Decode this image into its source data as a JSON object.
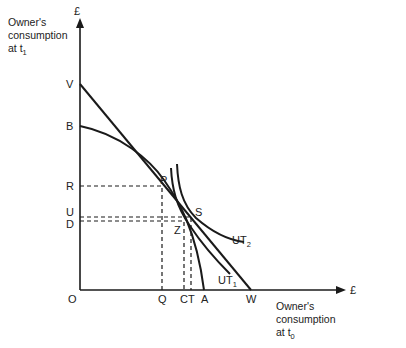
{
  "diagram": {
    "type": "indifference-curve diagram",
    "y_axis": {
      "unit": "£",
      "title_line1": "Owner's",
      "title_line2": "consumption",
      "title_line3": "at t",
      "title_sub": "1"
    },
    "x_axis": {
      "unit": "£",
      "title_line1": "Owner's",
      "title_line2": "consumption",
      "title_line3": "at t",
      "title_sub": "0"
    },
    "origin_label": "O",
    "y_labels": {
      "V": "V",
      "B": "B",
      "R": "R",
      "U": "U",
      "D": "D"
    },
    "x_labels": {
      "Q": "Q",
      "C": "C",
      "T": "T",
      "A": "A",
      "W": "W"
    },
    "point_labels": {
      "P": "P",
      "S": "S",
      "Z": "Z"
    },
    "curves": {
      "ut1": {
        "label": "UT",
        "sub": "1"
      },
      "ut2": {
        "label": "UT",
        "sub": "2"
      }
    },
    "elements": [
      "Straight market line V–W",
      "Concave production opportunity curve B–A",
      "Indifference curve UT1 tangent at P",
      "Indifference curve UT2 tangent at S",
      "Dashed projections R–P–Q, U–S–T, D–Z–C"
    ]
  }
}
